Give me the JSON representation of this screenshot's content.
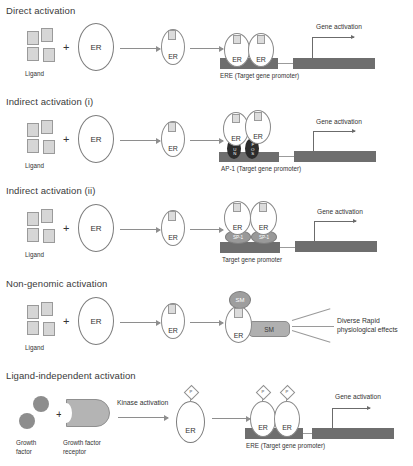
{
  "panels": [
    {
      "id": "direct",
      "title": "Direct activation",
      "ligand_label": "Ligand",
      "er_label": "ER",
      "plus": "+",
      "dimer": [
        "ER",
        "ER"
      ],
      "promoter_caption": "ERE (Target gene promoter)",
      "gene_activation_label": "Gene activation"
    },
    {
      "id": "indirect-i",
      "title": "Indirect activation (i)",
      "ligand_label": "Ligand",
      "er_label": "ER",
      "plus": "+",
      "dimer": [
        "ER",
        "ER"
      ],
      "cofactor_left": "JUN",
      "cofactor_right": "FOS",
      "promoter_caption": "AP-1 (Target gene promoter)",
      "gene_activation_label": "Gene activation"
    },
    {
      "id": "indirect-ii",
      "title": "Indirect activation (ii)",
      "ligand_label": "Ligand",
      "er_label": "ER",
      "plus": "+",
      "dimer": [
        "ER",
        "ER"
      ],
      "cofactor_left": "SP-1",
      "cofactor_right": "SP-1",
      "promoter_caption": "Target gene promoter",
      "gene_activation_label": "Gene activation"
    },
    {
      "id": "non-genomic",
      "title": "Non-genomic activation",
      "ligand_label": "Ligand",
      "er_label": "ER",
      "plus": "+",
      "signal_oval": "SM",
      "signal_box": "SM",
      "effects_line1": "Diverse Rapid",
      "effects_line2": "physiological effects"
    },
    {
      "id": "ligand-independent",
      "title": "Ligand-independent activation",
      "growth_factor_label_line1": "Growth",
      "growth_factor_label_line2": "factor",
      "receptor_label_line1": "Growth factor",
      "receptor_label_line2": "receptor",
      "plus": "+",
      "kinase_label": "Kinase activation",
      "er_label": "ER",
      "phosphate_label": "P",
      "dimer": [
        "ER",
        "ER"
      ],
      "promoter_caption": "ERE (Target gene promoter)",
      "gene_activation_label": "Gene activation"
    }
  ],
  "colors": {
    "promoter_bar": "#6e6e6e",
    "gene_bar": "#6e6e6e",
    "ap1_fill": "#2c2c2c",
    "sp1_fill": "#999999",
    "ligand_fill": "#d6d6d6",
    "receptor_fill": "#b4b4b4",
    "growth_factor_fill": "#8d8d8d"
  }
}
